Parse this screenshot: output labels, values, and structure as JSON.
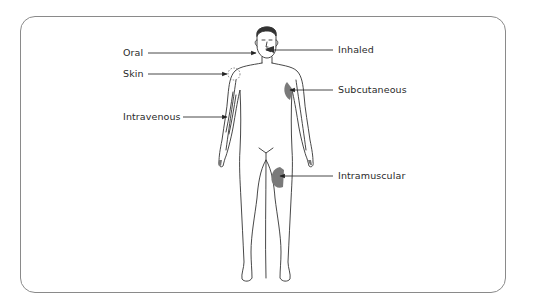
{
  "diagram": {
    "title": "",
    "routes_left": [
      {
        "id": "oral",
        "label": "Oral",
        "target": "mouth"
      },
      {
        "id": "skin",
        "label": "Skin",
        "target": "right-shoulder-skin"
      },
      {
        "id": "intravenous",
        "label": "Intravenous",
        "target": "right-forearm-vein"
      }
    ],
    "routes_right": [
      {
        "id": "inhaled",
        "label": "Inhaled",
        "target": "nose"
      },
      {
        "id": "subcutaneous",
        "label": "Subcutaneous",
        "target": "left-upper-arm"
      },
      {
        "id": "intramuscular",
        "label": "Intramuscular",
        "target": "left-thigh"
      }
    ],
    "colors": {
      "frame": "#8a8a8a",
      "outline": "#333333",
      "highlight_fill": "#7a7a7a",
      "text": "#2a2a2a"
    }
  }
}
